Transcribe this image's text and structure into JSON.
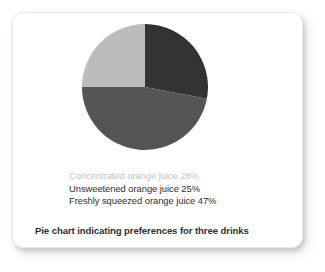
{
  "card": {
    "background_color": "#ffffff",
    "caption": "Pie chart indicating preferences for three drinks"
  },
  "legend": {
    "rows": [
      {
        "label": "Concentrated orange juice 28%",
        "color": "#c2c2c2",
        "style": "muted"
      },
      {
        "label": "Unsweetened orange juice 25%",
        "color": "#2e2e2e",
        "style": "primary"
      },
      {
        "label": "Freshly squeezed orange juice 47%",
        "color": "#2e2e2e",
        "style": "primary"
      }
    ]
  },
  "chart_data": {
    "type": "pie",
    "title": "Pie chart indicating preferences for three drinks",
    "xlabel": "",
    "ylabel": "",
    "legend_position": "bottom",
    "grid": false,
    "start_angle_deg": 0,
    "direction": "clockwise",
    "categories": [
      "Concentrated orange juice",
      "Freshly squeezed orange juice",
      "Unsweetened orange juice"
    ],
    "values": [
      28,
      47,
      25
    ],
    "unit": "%",
    "colors": [
      "#333333",
      "#555555",
      "#bcbcbc"
    ],
    "slices": [
      {
        "name": "Concentrated orange juice",
        "value": 28,
        "label": "Concentrated orange juice 28%",
        "color": "#333333",
        "start_angle_deg": 0,
        "end_angle_deg": 100.8,
        "path": "M 65 65 L 65 2 A 63 63 0 0 1 126.9 77.0 Z"
      },
      {
        "name": "Freshly squeezed orange juice",
        "value": 47,
        "label": "Freshly squeezed orange juice 47%",
        "color": "#555555",
        "start_angle_deg": 100.8,
        "end_angle_deg": 270.0,
        "path": "M 65 65 L 126.9 77.0 A 63 63 0 0 1 2 65 Z"
      },
      {
        "name": "Unsweetened orange juice",
        "value": 25,
        "label": "Unsweetened orange juice 25%",
        "color": "#bcbcbc",
        "start_angle_deg": 270.0,
        "end_angle_deg": 360.0,
        "path": "M 65 65 L 2 65 A 63 63 0 0 1 65 2 Z"
      }
    ]
  }
}
